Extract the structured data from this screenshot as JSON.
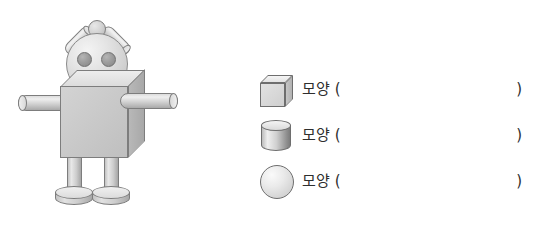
{
  "page": {
    "background_color": "#ffffff",
    "width": 538,
    "height": 226
  },
  "figure": {
    "name": "robot-made-of-solids",
    "parts": [
      {
        "name": "head",
        "solid": "sphere"
      },
      {
        "name": "head-knob",
        "solid": "sphere"
      },
      {
        "name": "eye-left",
        "solid": "sphere"
      },
      {
        "name": "eye-right",
        "solid": "sphere"
      },
      {
        "name": "antenna-left",
        "solid": "cylinder"
      },
      {
        "name": "antenna-right",
        "solid": "cylinder"
      },
      {
        "name": "body",
        "solid": "cube"
      },
      {
        "name": "arm-left",
        "solid": "cylinder"
      },
      {
        "name": "arm-right",
        "solid": "cylinder"
      },
      {
        "name": "leg-left",
        "solid": "cylinder"
      },
      {
        "name": "leg-right",
        "solid": "cylinder"
      },
      {
        "name": "foot-left",
        "solid": "cylinder"
      },
      {
        "name": "foot-right",
        "solid": "cylinder"
      }
    ]
  },
  "answers": {
    "rows": [
      {
        "icon": "cube-icon",
        "shape": "cube",
        "label": "모양 (",
        "close_paren": ")",
        "value": ""
      },
      {
        "icon": "cylinder-icon",
        "shape": "cylinder",
        "label": "모양 (",
        "close_paren": ")",
        "value": ""
      },
      {
        "icon": "sphere-icon",
        "shape": "sphere",
        "label": "모양 (",
        "close_paren": ")",
        "value": ""
      }
    ]
  },
  "colors": {
    "outline": "#6e6e6e",
    "face_front": "#c8c8c8",
    "face_top": "#e6e6e6",
    "face_side": "#b0b0b0",
    "eye": "#9a9a9a",
    "text": "#2e2e2e"
  }
}
